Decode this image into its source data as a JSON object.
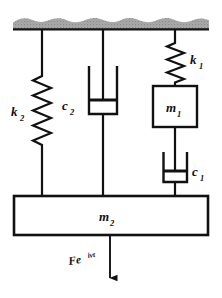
{
  "figure": {
    "kind": "mechanical-vibration-schematic",
    "background_color": "#ffffff",
    "line_color": "#111111",
    "ceiling_fill": "#a8a8a8"
  },
  "ceiling": {
    "name": "fixed-support",
    "label": ""
  },
  "elements": {
    "spring_k2": {
      "label": "k",
      "subscript": "2",
      "type": "spring",
      "attaches_top": "ceiling",
      "attaches_bottom": "m2"
    },
    "damper_c2": {
      "label": "c",
      "subscript": "2",
      "type": "damper",
      "attaches_top": "ceiling",
      "attaches_bottom": "m2"
    },
    "spring_k1": {
      "label": "k",
      "subscript": "1",
      "type": "spring",
      "attaches_top": "ceiling",
      "attaches_bottom": "m1"
    },
    "mass_m1": {
      "label": "m",
      "subscript": "1",
      "type": "mass-block"
    },
    "damper_c1": {
      "label": "c",
      "subscript": "1",
      "type": "damper",
      "attaches_top": "m1",
      "attaches_bottom": "m2"
    },
    "mass_m2": {
      "label": "m",
      "subscript": "2",
      "type": "mass-block"
    }
  },
  "force": {
    "base": "Fe",
    "exponent": "iνt",
    "full": "Fe^{iνt}",
    "direction": "downward",
    "applied_to": "m2"
  }
}
